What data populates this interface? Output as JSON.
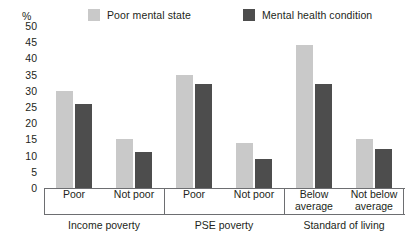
{
  "chart_data": {
    "type": "bar",
    "title": "",
    "xlabel": "",
    "ylabel": "%",
    "ylim": [
      0,
      50
    ],
    "ytick_step": 5,
    "yticks": [
      50,
      45,
      40,
      35,
      30,
      25,
      20,
      15,
      10,
      5,
      0
    ],
    "grid": false,
    "legend_position": "top",
    "categories": [
      "Poor",
      "Not poor",
      "Poor",
      "Not poor",
      "Below average",
      "Not below average"
    ],
    "groups": [
      {
        "name": "Income poverty",
        "categories": [
          "Poor",
          "Not poor"
        ]
      },
      {
        "name": "PSE poverty",
        "categories": [
          "Poor",
          "Not poor"
        ]
      },
      {
        "name": "Standard of living",
        "categories": [
          "Below average",
          "Not below average"
        ]
      }
    ],
    "series": [
      {
        "name": "Poor mental state",
        "color": "#c9c9c9",
        "values": [
          30,
          15,
          35,
          14,
          44,
          15
        ]
      },
      {
        "name": "Mental health condition",
        "color": "#4d4d4d",
        "values": [
          26,
          11,
          32,
          9,
          32,
          12
        ]
      }
    ]
  },
  "legend": {
    "entries": [
      {
        "label": "Poor mental state",
        "color": "#c9c9c9"
      },
      {
        "label": "Mental health condition",
        "color": "#4d4d4d"
      }
    ]
  },
  "axis": {
    "unit": "%",
    "ticks": [
      "50",
      "45",
      "40",
      "35",
      "30",
      "25",
      "20",
      "15",
      "10",
      "5",
      "0"
    ]
  },
  "category_labels": [
    {
      "line1": "Poor",
      "line2": ""
    },
    {
      "line1": "Not poor",
      "line2": ""
    },
    {
      "line1": "Poor",
      "line2": ""
    },
    {
      "line1": "Not poor",
      "line2": ""
    },
    {
      "line1": "Below",
      "line2": "average"
    },
    {
      "line1": "Not below",
      "line2": "average"
    }
  ],
  "group_labels": [
    "Income poverty",
    "PSE poverty",
    "Standard of living"
  ]
}
